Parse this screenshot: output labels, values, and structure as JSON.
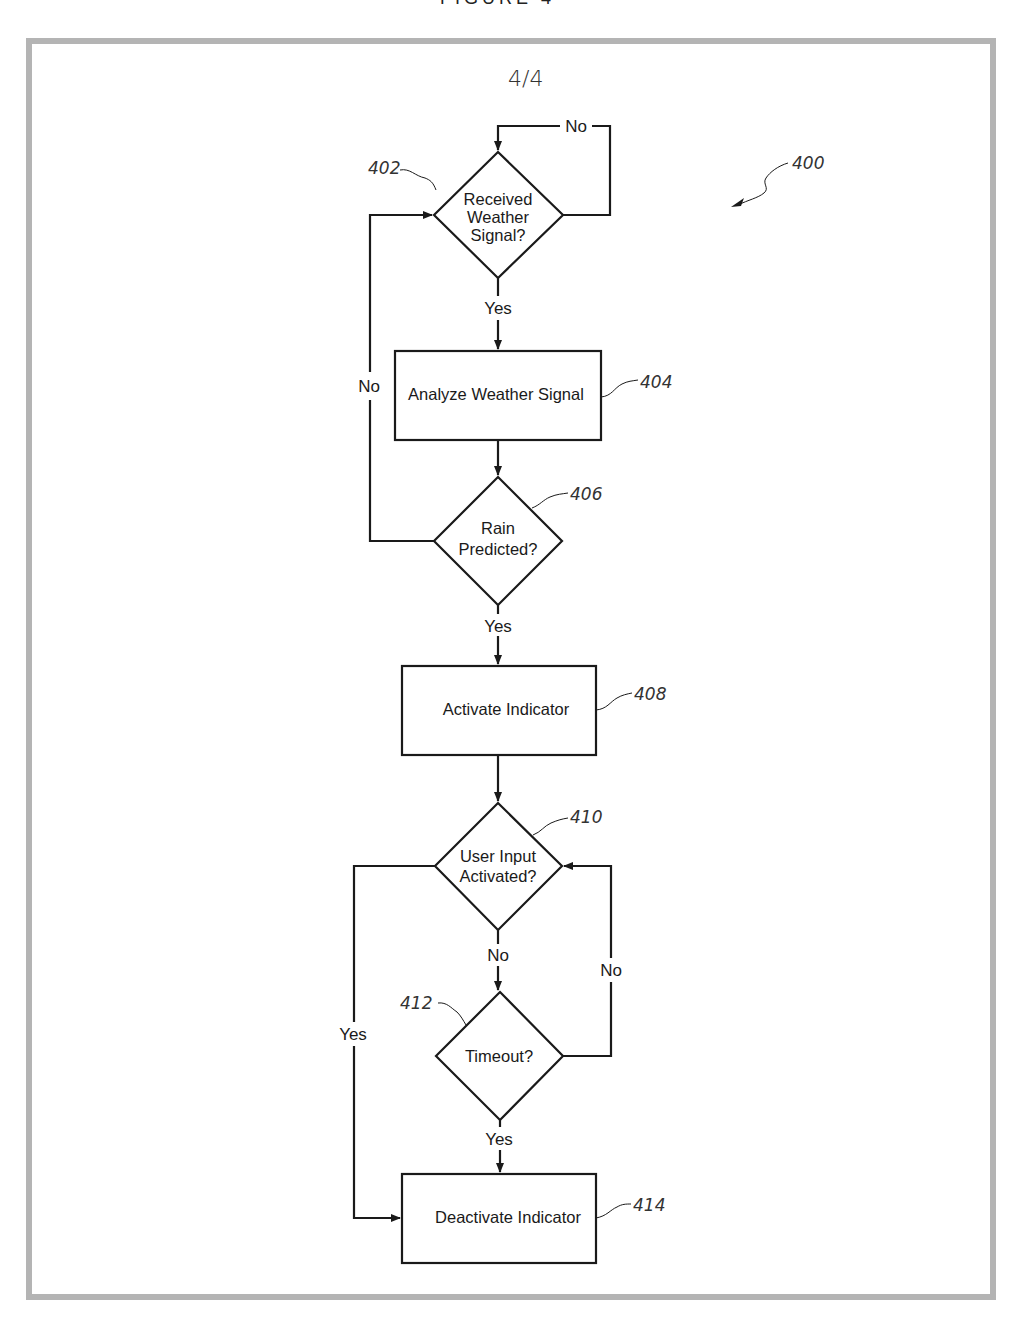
{
  "page": {
    "header_cut_text": "FIGURE 4",
    "sheet_number": "4/4",
    "figure_ref": "400"
  },
  "nodes": {
    "n402": {
      "ref": "402",
      "type": "decision",
      "lines": [
        "Received",
        "Weather",
        "Signal?"
      ]
    },
    "n404": {
      "ref": "404",
      "type": "process",
      "label": "Analyze Weather Signal"
    },
    "n406": {
      "ref": "406",
      "type": "decision",
      "lines": [
        "Rain",
        "Predicted?"
      ]
    },
    "n408": {
      "ref": "408",
      "type": "process",
      "label": "Activate Indicator"
    },
    "n410": {
      "ref": "410",
      "type": "decision",
      "lines": [
        "User Input",
        "Activated?"
      ]
    },
    "n412": {
      "ref": "412",
      "type": "decision",
      "lines": [
        "Timeout?"
      ]
    },
    "n414": {
      "ref": "414",
      "type": "process",
      "label": "Deactivate Indicator"
    }
  },
  "edges": {
    "e402_no": {
      "from": "402",
      "to": "402",
      "label": "No"
    },
    "e402_yes": {
      "from": "402",
      "to": "404",
      "label": "Yes"
    },
    "e404_406": {
      "from": "404",
      "to": "406",
      "label": ""
    },
    "e406_no": {
      "from": "406",
      "to": "402",
      "label": "No"
    },
    "e406_yes": {
      "from": "406",
      "to": "408",
      "label": "Yes"
    },
    "e408_410": {
      "from": "408",
      "to": "410",
      "label": ""
    },
    "e410_no": {
      "from": "410",
      "to": "412",
      "label": "No"
    },
    "e410_yes": {
      "from": "410",
      "to": "414",
      "label": "Yes"
    },
    "e412_no": {
      "from": "412",
      "to": "410",
      "label": "No"
    },
    "e412_yes": {
      "from": "412",
      "to": "414",
      "label": "Yes"
    }
  },
  "colors": {
    "line": "#1a1a1a",
    "frame": "#b4b4b4",
    "background": "#ffffff"
  }
}
